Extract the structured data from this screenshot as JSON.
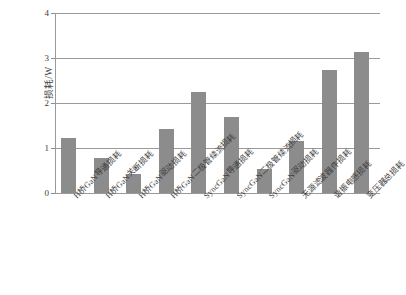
{
  "chart_data": {
    "type": "bar",
    "title": "",
    "subtitle": "",
    "xlabel": "",
    "ylabel": "损耗/W",
    "ylim": [
      0,
      4
    ],
    "ytick_labels": [
      "0",
      "1",
      "2",
      "3",
      "4"
    ],
    "yticks": [
      0,
      1,
      2,
      3,
      4
    ],
    "grid": true,
    "legend": false,
    "legend_position": "none",
    "bar_color": "#8c8c8c",
    "grid_color": "#9a9a9a",
    "axis_color": "#9a9a9a",
    "categories": [
      "H桥GaN导通损耗",
      "H桥GaN关断损耗",
      "H桥GaN驱动损耗",
      "H桥GaN二极管续流损耗",
      "SyncGaN导通损耗",
      "SyncGaN二极管续流损耗",
      "SyncGaN驱动损耗",
      "无源滤波器件损耗",
      "谐振电感损耗",
      "变压器总损耗"
    ],
    "values": [
      1.22,
      0.78,
      0.42,
      1.42,
      2.25,
      1.7,
      0.54,
      1.15,
      2.73,
      3.14
    ]
  }
}
